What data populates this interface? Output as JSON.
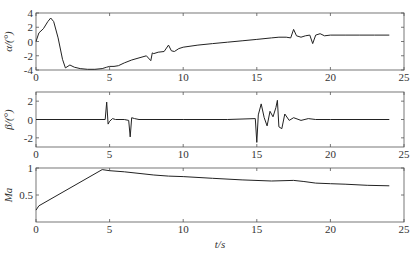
{
  "chart_data": [
    {
      "type": "line",
      "title": "",
      "xlabel": "",
      "ylabel": "α/(°)",
      "xlim": [
        0,
        25
      ],
      "ylim": [
        -4,
        4
      ],
      "xticks": [
        0,
        5,
        10,
        15,
        20,
        25
      ],
      "yticks": [
        -4,
        -2,
        0,
        2,
        4
      ],
      "grid": false,
      "series": [
        {
          "name": "alpha",
          "x": [
            0,
            0.2,
            0.5,
            0.8,
            1.0,
            1.2,
            1.5,
            1.8,
            2.0,
            2.3,
            2.6,
            3.0,
            3.5,
            4.0,
            4.5,
            4.8,
            5.0,
            5.3,
            5.6,
            6.0,
            6.5,
            7.0,
            7.5,
            7.8,
            7.9,
            8.0,
            8.3,
            8.7,
            9.0,
            9.2,
            9.4,
            9.7,
            10.0,
            11,
            12,
            13,
            14,
            15,
            16,
            16.5,
            17,
            17.3,
            17.5,
            17.7,
            18.0,
            18.3,
            18.6,
            18.8,
            19.0,
            19.3,
            19.6,
            20.0,
            21,
            22,
            23,
            24
          ],
          "y": [
            0,
            1.2,
            1.8,
            2.8,
            3.3,
            2.8,
            0.5,
            -2.5,
            -3.7,
            -3.3,
            -3.6,
            -3.8,
            -3.9,
            -3.9,
            -3.8,
            -3.6,
            -3.5,
            -3.5,
            -3.4,
            -3.0,
            -2.6,
            -2.3,
            -2.0,
            -2.7,
            -1.6,
            -1.7,
            -1.5,
            -1.4,
            -0.5,
            -1.3,
            -1.4,
            -1.0,
            -0.8,
            -0.5,
            -0.3,
            -0.1,
            0.1,
            0.3,
            0.5,
            0.6,
            0.6,
            0.5,
            1.7,
            0.8,
            0.6,
            0.8,
            0.9,
            -0.3,
            0.9,
            1.1,
            0.8,
            0.9,
            0.9,
            0.9,
            0.9,
            0.9
          ]
        }
      ]
    },
    {
      "type": "line",
      "title": "",
      "xlabel": "",
      "ylabel": "β/(°)",
      "xlim": [
        0,
        25
      ],
      "ylim": [
        -3,
        3
      ],
      "xticks": [
        0,
        5,
        10,
        15,
        20,
        25
      ],
      "yticks": [
        -2,
        0,
        2
      ],
      "grid": false,
      "series": [
        {
          "name": "beta",
          "x": [
            0,
            4.7,
            4.8,
            4.9,
            5.0,
            5.2,
            5.4,
            6.0,
            6.3,
            6.4,
            6.5,
            6.7,
            7.0,
            10,
            13,
            14.9,
            15.0,
            15.1,
            15.3,
            15.5,
            15.7,
            15.9,
            16.1,
            16.3,
            16.4,
            16.5,
            16.7,
            16.9,
            17.2,
            17.5,
            18.0,
            18.5,
            19,
            20,
            24
          ],
          "y": [
            0,
            0,
            1.9,
            -0.5,
            -0.2,
            0.1,
            0,
            0,
            -0.1,
            -1.9,
            0.2,
            0.1,
            0,
            0,
            0,
            0.1,
            -2.5,
            0.5,
            1.7,
            0.2,
            -0.7,
            0.9,
            0.3,
            1.3,
            2.1,
            -0.8,
            -1.0,
            0.6,
            -0.1,
            0.2,
            -0.1,
            0.1,
            0,
            0,
            0
          ]
        }
      ]
    },
    {
      "type": "line",
      "title": "",
      "xlabel": "t/s",
      "ylabel": "Ma",
      "xlim": [
        0,
        25
      ],
      "ylim": [
        0,
        1
      ],
      "xticks": [
        0,
        5,
        10,
        15,
        20,
        25
      ],
      "yticks": [
        0.5,
        1
      ],
      "grid": false,
      "series": [
        {
          "name": "Ma",
          "x": [
            0,
            0.2,
            4.5,
            5.0,
            6.0,
            7.0,
            8.0,
            9.0,
            10.0,
            12.0,
            14.0,
            16.0,
            17.5,
            18.2,
            19.0,
            20.0,
            21.0,
            22.5,
            24.0
          ],
          "y": [
            0.22,
            0.3,
            0.97,
            0.95,
            0.93,
            0.9,
            0.87,
            0.85,
            0.84,
            0.81,
            0.78,
            0.76,
            0.77,
            0.75,
            0.72,
            0.71,
            0.7,
            0.68,
            0.67
          ]
        }
      ]
    }
  ],
  "axes_text": {
    "alpha_label": "α/(°)",
    "beta_label": "β/(°)",
    "ma_label": "Ma",
    "t_label": "t/s"
  }
}
